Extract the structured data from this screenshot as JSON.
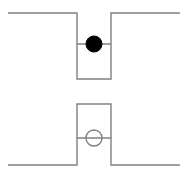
{
  "figure": {
    "width": 186,
    "height": 178,
    "background_color": "#ffffff",
    "stroke_color": "#808080",
    "fill_color": "#000000",
    "line_width": 1.4,
    "title": "",
    "caption": ""
  },
  "chart_data": {
    "type": "line",
    "title": "",
    "subtitle": "",
    "xlabel": "",
    "ylabel": "",
    "xlim": [
      0,
      186
    ],
    "ylim": [
      178,
      0
    ],
    "grid": false,
    "legend_position": "none",
    "axes_visible": false,
    "tick_labels_x": [],
    "tick_labels_y": [],
    "panels": [
      {
        "name": "potential-well-panel",
        "description": "square potential well with filled particle marker",
        "series": [
          {
            "name": "potential-well-profile",
            "type": "line",
            "color": "#808080",
            "width": 1.4,
            "closed": false,
            "points": [
              [
                8,
                13
              ],
              [
                77,
                13
              ],
              [
                77,
                79
              ],
              [
                111,
                79
              ],
              [
                111,
                13
              ],
              [
                180,
                13
              ]
            ]
          },
          {
            "name": "energy-level-line",
            "type": "line",
            "color": "#808080",
            "width": 1.4,
            "closed": false,
            "points": [
              [
                77,
                44
              ],
              [
                111,
                44
              ]
            ]
          }
        ],
        "markers": [
          {
            "name": "filled-particle-marker",
            "shape": "circle",
            "cx": 94,
            "cy": 44,
            "r": 8,
            "fill": "#000000",
            "stroke": "#000000",
            "stroke_width": 1
          }
        ]
      },
      {
        "name": "potential-barrier-panel",
        "description": "square potential barrier with open particle marker",
        "series": [
          {
            "name": "potential-barrier-profile",
            "type": "line",
            "color": "#808080",
            "width": 1.4,
            "closed": false,
            "points": [
              [
                8,
                165
              ],
              [
                77,
                165
              ],
              [
                77,
                104
              ],
              [
                111,
                104
              ],
              [
                111,
                165
              ],
              [
                180,
                165
              ]
            ]
          },
          {
            "name": "energy-level-line",
            "type": "line",
            "color": "#808080",
            "width": 1.4,
            "closed": false,
            "points": [
              [
                77,
                138
              ],
              [
                111,
                138
              ]
            ]
          }
        ],
        "markers": [
          {
            "name": "open-particle-marker",
            "shape": "circle",
            "cx": 94,
            "cy": 138,
            "r": 8,
            "fill": "none",
            "stroke": "#808080",
            "stroke_width": 1.4
          }
        ]
      }
    ]
  }
}
